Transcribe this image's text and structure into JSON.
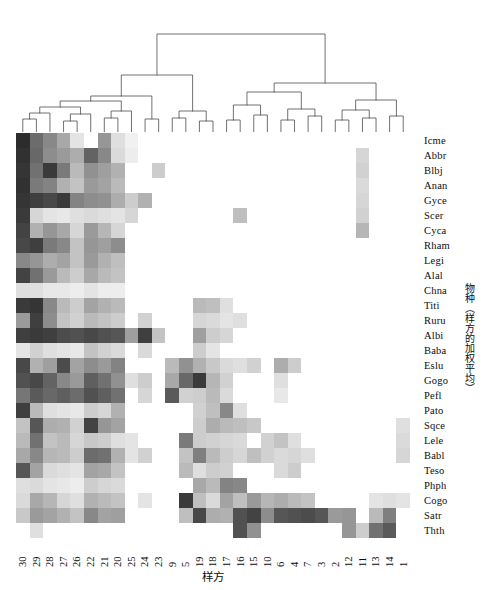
{
  "figure": {
    "type": "heatmap-with-dendrogram",
    "x_axis_title": "样方",
    "y_axis_title": "物种（样方的加权平均）"
  },
  "chart_data": {
    "type": "heatmap",
    "title": "",
    "xlabel": "样方",
    "ylabel": "物种（样方的加权平均）",
    "grid": false,
    "legend": "none",
    "colormap": "grayscale-reversed",
    "value_range": [
      0,
      1
    ],
    "color_stops": [
      "#ffffff",
      "#1a1a1a"
    ],
    "categories_x": [
      "30",
      "29",
      "28",
      "27",
      "26",
      "22",
      "21",
      "20",
      "25",
      "24",
      "23",
      "9",
      "5",
      "19",
      "18",
      "17",
      "16",
      "15",
      "10",
      "6",
      "4",
      "7",
      "3",
      "2",
      "12",
      "11",
      "13",
      "14",
      "1"
    ],
    "categories_y": [
      "Icme",
      "Abbr",
      "Blbj",
      "Anan",
      "Gyce",
      "Scer",
      "Cyca",
      "Rham",
      "Legi",
      "Alal",
      "Chna",
      "Titi",
      "Ruru",
      "Albi",
      "Baba",
      "Eslu",
      "Gogo",
      "Pefl",
      "Pato",
      "Sqce",
      "Lele",
      "Babl",
      "Teso",
      "Phph",
      "Cogo",
      "Satr",
      "Thth"
    ],
    "values": [
      [
        0.92,
        0.64,
        0.52,
        0.38,
        0.12,
        0.0,
        0.46,
        0.14,
        0.06,
        0.0,
        0.0,
        0.0,
        0.0,
        0.0,
        0.0,
        0.0,
        0.0,
        0.0,
        0.0,
        0.0,
        0.0,
        0.0,
        0.0,
        0.0,
        0.0,
        0.0,
        0.0,
        0.0,
        0.0
      ],
      [
        0.9,
        0.66,
        0.5,
        0.44,
        0.36,
        0.68,
        0.52,
        0.16,
        0.08,
        0.0,
        0.0,
        0.0,
        0.0,
        0.0,
        0.0,
        0.0,
        0.0,
        0.0,
        0.0,
        0.0,
        0.0,
        0.0,
        0.0,
        0.0,
        0.0,
        0.18,
        0.0,
        0.0,
        0.0
      ],
      [
        0.88,
        0.62,
        0.86,
        0.58,
        0.3,
        0.48,
        0.42,
        0.34,
        0.0,
        0.0,
        0.22,
        0.0,
        0.0,
        0.0,
        0.0,
        0.0,
        0.0,
        0.0,
        0.0,
        0.0,
        0.0,
        0.0,
        0.0,
        0.0,
        0.0,
        0.2,
        0.0,
        0.0,
        0.0
      ],
      [
        0.9,
        0.58,
        0.54,
        0.34,
        0.26,
        0.44,
        0.4,
        0.3,
        0.0,
        0.0,
        0.0,
        0.0,
        0.0,
        0.0,
        0.0,
        0.0,
        0.0,
        0.0,
        0.0,
        0.0,
        0.0,
        0.0,
        0.0,
        0.0,
        0.0,
        0.16,
        0.0,
        0.0,
        0.0
      ],
      [
        0.88,
        0.84,
        0.8,
        0.86,
        0.54,
        0.5,
        0.48,
        0.36,
        0.22,
        0.34,
        0.0,
        0.0,
        0.0,
        0.0,
        0.0,
        0.0,
        0.0,
        0.0,
        0.0,
        0.0,
        0.0,
        0.0,
        0.0,
        0.0,
        0.0,
        0.18,
        0.0,
        0.0,
        0.0
      ],
      [
        0.86,
        0.18,
        0.12,
        0.1,
        0.14,
        0.16,
        0.14,
        0.12,
        0.18,
        0.0,
        0.0,
        0.0,
        0.0,
        0.0,
        0.0,
        0.0,
        0.28,
        0.0,
        0.0,
        0.0,
        0.0,
        0.0,
        0.0,
        0.0,
        0.0,
        0.2,
        0.0,
        0.0,
        0.0
      ],
      [
        0.82,
        0.34,
        0.46,
        0.38,
        0.18,
        0.44,
        0.32,
        0.18,
        0.0,
        0.0,
        0.0,
        0.0,
        0.0,
        0.0,
        0.0,
        0.0,
        0.0,
        0.0,
        0.0,
        0.0,
        0.0,
        0.0,
        0.0,
        0.0,
        0.0,
        0.32,
        0.0,
        0.0,
        0.0
      ],
      [
        0.8,
        0.84,
        0.58,
        0.52,
        0.26,
        0.46,
        0.42,
        0.5,
        0.0,
        0.0,
        0.0,
        0.0,
        0.0,
        0.0,
        0.0,
        0.0,
        0.0,
        0.0,
        0.0,
        0.0,
        0.0,
        0.0,
        0.0,
        0.0,
        0.0,
        0.0,
        0.0,
        0.0,
        0.0
      ],
      [
        0.52,
        0.46,
        0.36,
        0.4,
        0.26,
        0.44,
        0.34,
        0.28,
        0.0,
        0.0,
        0.0,
        0.0,
        0.0,
        0.0,
        0.0,
        0.0,
        0.0,
        0.0,
        0.0,
        0.0,
        0.0,
        0.0,
        0.0,
        0.0,
        0.0,
        0.0,
        0.0,
        0.0,
        0.0
      ],
      [
        0.82,
        0.62,
        0.44,
        0.3,
        0.22,
        0.38,
        0.3,
        0.26,
        0.0,
        0.0,
        0.0,
        0.0,
        0.0,
        0.0,
        0.0,
        0.0,
        0.0,
        0.0,
        0.0,
        0.0,
        0.0,
        0.0,
        0.0,
        0.0,
        0.0,
        0.0,
        0.0,
        0.0,
        0.0
      ],
      [
        0.14,
        0.14,
        0.1,
        0.1,
        0.08,
        0.12,
        0.08,
        0.08,
        0.0,
        0.0,
        0.0,
        0.0,
        0.0,
        0.0,
        0.0,
        0.0,
        0.0,
        0.0,
        0.0,
        0.0,
        0.0,
        0.0,
        0.0,
        0.0,
        0.0,
        0.0,
        0.0,
        0.0,
        0.0
      ],
      [
        0.86,
        0.88,
        0.52,
        0.3,
        0.22,
        0.4,
        0.34,
        0.3,
        0.0,
        0.0,
        0.0,
        0.0,
        0.0,
        0.3,
        0.28,
        0.14,
        0.0,
        0.0,
        0.0,
        0.0,
        0.0,
        0.0,
        0.0,
        0.0,
        0.0,
        0.0,
        0.0,
        0.0,
        0.0
      ],
      [
        0.44,
        0.84,
        0.5,
        0.26,
        0.2,
        0.3,
        0.26,
        0.22,
        0.0,
        0.2,
        0.0,
        0.0,
        0.0,
        0.18,
        0.16,
        0.12,
        0.14,
        0.0,
        0.0,
        0.0,
        0.0,
        0.0,
        0.0,
        0.0,
        0.0,
        0.0,
        0.0,
        0.0,
        0.0
      ],
      [
        0.84,
        0.86,
        0.84,
        0.78,
        0.76,
        0.8,
        0.76,
        0.74,
        0.42,
        0.84,
        0.26,
        0.0,
        0.0,
        0.42,
        0.22,
        0.18,
        0.0,
        0.0,
        0.0,
        0.0,
        0.0,
        0.0,
        0.0,
        0.0,
        0.0,
        0.0,
        0.0,
        0.0,
        0.0
      ],
      [
        0.12,
        0.2,
        0.14,
        0.12,
        0.1,
        0.26,
        0.2,
        0.16,
        0.0,
        0.16,
        0.0,
        0.0,
        0.0,
        0.22,
        0.12,
        0.0,
        0.0,
        0.0,
        0.0,
        0.0,
        0.0,
        0.0,
        0.0,
        0.0,
        0.0,
        0.0,
        0.0,
        0.0,
        0.0
      ],
      [
        0.8,
        0.34,
        0.42,
        0.78,
        0.4,
        0.5,
        0.44,
        0.54,
        0.0,
        0.0,
        0.0,
        0.3,
        0.48,
        0.34,
        0.24,
        0.16,
        0.14,
        0.2,
        0.0,
        0.36,
        0.22,
        0.0,
        0.0,
        0.0,
        0.0,
        0.0,
        0.0,
        0.0,
        0.0
      ],
      [
        0.76,
        0.8,
        0.68,
        0.52,
        0.44,
        0.7,
        0.62,
        0.48,
        0.14,
        0.22,
        0.0,
        0.38,
        0.66,
        0.86,
        0.32,
        0.2,
        0.0,
        0.0,
        0.0,
        0.14,
        0.0,
        0.0,
        0.0,
        0.0,
        0.0,
        0.0,
        0.0,
        0.0,
        0.0
      ],
      [
        0.6,
        0.72,
        0.66,
        0.7,
        0.64,
        0.76,
        0.7,
        0.62,
        0.0,
        0.18,
        0.0,
        0.72,
        0.2,
        0.22,
        0.3,
        0.16,
        0.0,
        0.0,
        0.0,
        0.1,
        0.0,
        0.0,
        0.0,
        0.0,
        0.0,
        0.0,
        0.0,
        0.0,
        0.0
      ],
      [
        0.84,
        0.3,
        0.14,
        0.12,
        0.1,
        0.22,
        0.18,
        0.34,
        0.0,
        0.0,
        0.0,
        0.0,
        0.0,
        0.2,
        0.28,
        0.52,
        0.14,
        0.0,
        0.0,
        0.0,
        0.0,
        0.0,
        0.0,
        0.0,
        0.0,
        0.0,
        0.0,
        0.0,
        0.0
      ],
      [
        0.26,
        0.74,
        0.36,
        0.34,
        0.2,
        0.82,
        0.46,
        0.4,
        0.0,
        0.0,
        0.0,
        0.0,
        0.0,
        0.22,
        0.36,
        0.3,
        0.28,
        0.24,
        0.0,
        0.0,
        0.0,
        0.0,
        0.0,
        0.0,
        0.0,
        0.0,
        0.0,
        0.0,
        0.14
      ],
      [
        0.3,
        0.62,
        0.26,
        0.3,
        0.18,
        0.24,
        0.22,
        0.14,
        0.12,
        0.0,
        0.0,
        0.0,
        0.58,
        0.22,
        0.2,
        0.18,
        0.16,
        0.0,
        0.2,
        0.26,
        0.14,
        0.0,
        0.0,
        0.0,
        0.0,
        0.0,
        0.0,
        0.0,
        0.16
      ],
      [
        0.38,
        0.52,
        0.32,
        0.3,
        0.22,
        0.64,
        0.62,
        0.34,
        0.12,
        0.2,
        0.0,
        0.0,
        0.26,
        0.56,
        0.3,
        0.22,
        0.18,
        0.28,
        0.2,
        0.16,
        0.18,
        0.14,
        0.0,
        0.0,
        0.0,
        0.0,
        0.0,
        0.0,
        0.18
      ],
      [
        0.74,
        0.4,
        0.16,
        0.14,
        0.12,
        0.4,
        0.38,
        0.26,
        0.0,
        0.0,
        0.0,
        0.0,
        0.3,
        0.14,
        0.22,
        0.2,
        0.0,
        0.0,
        0.0,
        0.16,
        0.22,
        0.0,
        0.0,
        0.0,
        0.0,
        0.0,
        0.0,
        0.0,
        0.0
      ],
      [
        0.14,
        0.16,
        0.12,
        0.1,
        0.08,
        0.22,
        0.18,
        0.16,
        0.0,
        0.0,
        0.0,
        0.0,
        0.0,
        0.38,
        0.3,
        0.54,
        0.52,
        0.0,
        0.0,
        0.0,
        0.0,
        0.0,
        0.0,
        0.0,
        0.0,
        0.0,
        0.0,
        0.0,
        0.0
      ],
      [
        0.16,
        0.38,
        0.32,
        0.18,
        0.14,
        0.34,
        0.3,
        0.26,
        0.0,
        0.12,
        0.0,
        0.0,
        0.86,
        0.28,
        0.16,
        0.4,
        0.28,
        0.44,
        0.32,
        0.36,
        0.3,
        0.26,
        0.0,
        0.0,
        0.0,
        0.0,
        0.12,
        0.14,
        0.12
      ],
      [
        0.24,
        0.44,
        0.4,
        0.34,
        0.26,
        0.52,
        0.4,
        0.42,
        0.0,
        0.0,
        0.0,
        0.0,
        0.28,
        0.8,
        0.36,
        0.34,
        0.76,
        0.82,
        0.5,
        0.74,
        0.76,
        0.78,
        0.74,
        0.44,
        0.46,
        0.0,
        0.3,
        0.56,
        0.0
      ],
      [
        0.0,
        0.14,
        0.0,
        0.0,
        0.0,
        0.0,
        0.0,
        0.0,
        0.0,
        0.0,
        0.0,
        0.0,
        0.0,
        0.0,
        0.0,
        0.0,
        0.76,
        0.48,
        0.0,
        0.0,
        0.0,
        0.0,
        0.0,
        0.0,
        0.46,
        0.22,
        0.62,
        0.72,
        0.0
      ]
    ]
  },
  "dendrogram": {
    "orientation": "top",
    "leaf_count": 29,
    "description": "hierarchical clustering of 样方 (plots)",
    "links": [
      {
        "x1": 6.8,
        "x2": 20.4,
        "y": 104
      },
      {
        "x1": 13.6,
        "x2": 34.0,
        "y": 97
      },
      {
        "x1": 47.6,
        "x2": 61.2,
        "y": 107
      },
      {
        "x1": 54.4,
        "x2": 74.8,
        "y": 100
      },
      {
        "x1": 23.8,
        "x2": 64.6,
        "y": 93
      },
      {
        "x1": 95.2,
        "x2": 108.8,
        "y": 105
      },
      {
        "x1": 102.0,
        "x2": 122.4,
        "y": 98
      },
      {
        "x1": 44.2,
        "x2": 112.2,
        "y": 91
      },
      {
        "x1": 149.6,
        "x2": 163.2,
        "y": 104
      },
      {
        "x1": 176.8,
        "x2": 190.4,
        "y": 104
      },
      {
        "x1": 156.4,
        "x2": 183.6,
        "y": 94
      },
      {
        "x1": 78.2,
        "x2": 170.0,
        "y": 66
      },
      {
        "x1": 217.6,
        "x2": 217.6,
        "y": 80
      },
      {
        "x1": 244.8,
        "x2": 258.4,
        "y": 104
      },
      {
        "x1": 272.0,
        "x2": 285.6,
        "y": 104
      },
      {
        "x1": 251.6,
        "x2": 278.8,
        "y": 95
      },
      {
        "x1": 312.8,
        "x2": 326.4,
        "y": 104
      },
      {
        "x1": 265.2,
        "x2": 319.6,
        "y": 85
      },
      {
        "x1": 217.6,
        "x2": 292.4,
        "y": 76
      },
      {
        "x1": 353.6,
        "x2": 367.2,
        "y": 104
      },
      {
        "x1": 380.8,
        "x2": 394.4,
        "y": 104
      },
      {
        "x1": 360.4,
        "x2": 387.6,
        "y": 97
      },
      {
        "x1": 374.0,
        "x2": 401.2,
        "y": 88
      },
      {
        "x1": 255.0,
        "x2": 387.6,
        "y": 60
      },
      {
        "x1": 124.1,
        "x2": 321.3,
        "y": 22
      }
    ]
  }
}
